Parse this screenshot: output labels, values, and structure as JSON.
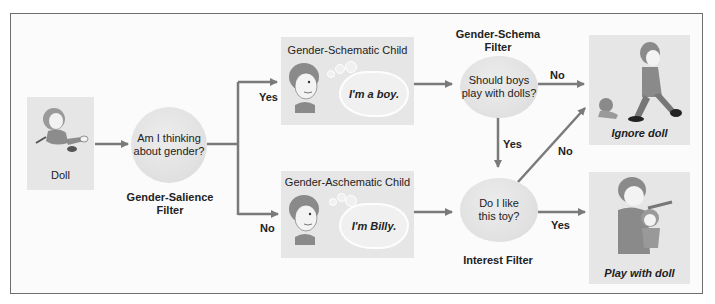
{
  "colors": {
    "frame": "#6e6e6e",
    "box": "#e6e6e6",
    "arrow": "#7a7a7a",
    "text": "#222222"
  },
  "doll_box": {
    "label": "Doll",
    "icon": "doll-icon"
  },
  "salience_filter": {
    "question_line1": "Am I thinking",
    "question_line2": "about gender?",
    "caption_line1": "Gender-Salience",
    "caption_line2": "Filter"
  },
  "schematic_child": {
    "title": "Gender-Schematic Child",
    "thought": "I'm a boy.",
    "icon": "boy-face-icon"
  },
  "aschematic_child": {
    "title": "Gender-Aschematic Child",
    "thought": "I'm Billy.",
    "icon": "boy-face-icon"
  },
  "schema_filter": {
    "caption_line1": "Gender-Schema",
    "caption_line2": "Filter",
    "question_line1": "Should boys",
    "question_line2": "play with dolls?"
  },
  "interest_filter": {
    "question_line1": "Do I like",
    "question_line2": "this toy?",
    "caption": "Interest Filter"
  },
  "outcomes": {
    "ignore": {
      "label": "Ignore doll",
      "icon": "boy-walking-away-icon"
    },
    "play": {
      "label": "Play with doll",
      "icon": "boy-holding-doll-icon"
    }
  },
  "edge_labels": {
    "salience_yes": "Yes",
    "salience_no": "No",
    "schema_no": "No",
    "schema_yes": "Yes",
    "interest_no": "No",
    "interest_yes": "Yes"
  }
}
